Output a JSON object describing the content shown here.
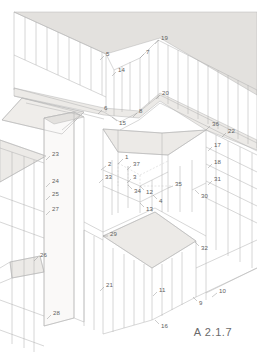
{
  "drawing": {
    "sheet_code": "A 2.1.7",
    "style": {
      "background": "#ffffff",
      "line_color": "#b4b4b4",
      "line_color_dark": "#9a9a9a",
      "plane_fill": "#e3e1de",
      "plane_fill_light": "#eceae7",
      "plane_fill_pale": "#f2f1ef",
      "label_color": "#5e5e5e",
      "leader_color": "#8d8d8d",
      "hidden_line_color": "#c2c2c2"
    },
    "callouts": [
      {
        "id": "1",
        "text": "1",
        "x": 125,
        "y": 157,
        "lx1": 123,
        "ly1": 159,
        "lx2": 118,
        "ly2": 164
      },
      {
        "id": "2",
        "text": "2",
        "x": 108,
        "y": 164,
        "lx1": 106,
        "ly1": 166,
        "lx2": 101,
        "ly2": 170
      },
      {
        "id": "3",
        "text": "3",
        "x": 133,
        "y": 177,
        "lx1": 131,
        "ly1": 179,
        "lx2": 127,
        "ly2": 183
      },
      {
        "id": "4",
        "text": "4",
        "x": 159,
        "y": 201,
        "lx1": 157,
        "ly1": 199,
        "lx2": 153,
        "ly2": 195
      },
      {
        "id": "5",
        "text": "5",
        "x": 106,
        "y": 54,
        "lx1": 104,
        "ly1": 56,
        "lx2": 100,
        "ly2": 60
      },
      {
        "id": "6",
        "text": "6",
        "x": 104,
        "y": 108,
        "lx1": 102,
        "ly1": 110,
        "lx2": 98,
        "ly2": 114
      },
      {
        "id": "7",
        "text": "7",
        "x": 146,
        "y": 52,
        "lx1": 144,
        "ly1": 54,
        "lx2": 140,
        "ly2": 58
      },
      {
        "id": "8",
        "text": "8",
        "x": 139,
        "y": 111,
        "lx1": 137,
        "ly1": 113,
        "lx2": 133,
        "ly2": 117
      },
      {
        "id": "9",
        "text": "9",
        "x": 199,
        "y": 303,
        "lx1": 197,
        "ly1": 301,
        "lx2": 193,
        "ly2": 297
      },
      {
        "id": "10",
        "text": "10",
        "x": 219,
        "y": 291,
        "lx1": 217,
        "ly1": 293,
        "lx2": 212,
        "ly2": 297
      },
      {
        "id": "11",
        "text": "11",
        "x": 159,
        "y": 290,
        "lx1": 157,
        "ly1": 292,
        "lx2": 153,
        "ly2": 296
      },
      {
        "id": "12",
        "text": "12",
        "x": 146,
        "y": 192,
        "lx1": 144,
        "ly1": 190,
        "lx2": 140,
        "ly2": 186
      },
      {
        "id": "13",
        "text": "13",
        "x": 146,
        "y": 209,
        "lx1": 144,
        "ly1": 207,
        "lx2": 140,
        "ly2": 203
      },
      {
        "id": "14",
        "text": "14",
        "x": 118,
        "y": 70,
        "lx1": 116,
        "ly1": 72,
        "lx2": 112,
        "ly2": 76
      },
      {
        "id": "15",
        "text": "15",
        "x": 119,
        "y": 123,
        "lx1": 117,
        "ly1": 121,
        "lx2": 112,
        "ly2": 117
      },
      {
        "id": "16",
        "text": "16",
        "x": 161,
        "y": 326,
        "lx1": 159,
        "ly1": 324,
        "lx2": 155,
        "ly2": 320
      },
      {
        "id": "17",
        "text": "17",
        "x": 214,
        "y": 145,
        "lx1": 212,
        "ly1": 147,
        "lx2": 208,
        "ly2": 151
      },
      {
        "id": "18",
        "text": "18",
        "x": 214,
        "y": 162,
        "lx1": 212,
        "ly1": 164,
        "lx2": 208,
        "ly2": 168
      },
      {
        "id": "19",
        "text": "19",
        "x": 161,
        "y": 38,
        "lx1": 159,
        "ly1": 40,
        "lx2": 155,
        "ly2": 44
      },
      {
        "id": "20",
        "text": "20",
        "x": 162,
        "y": 93,
        "lx1": 160,
        "ly1": 95,
        "lx2": 156,
        "ly2": 99
      },
      {
        "id": "21",
        "text": "21",
        "x": 106,
        "y": 285,
        "lx1": 104,
        "ly1": 287,
        "lx2": 100,
        "ly2": 291
      },
      {
        "id": "22",
        "text": "22",
        "x": 228,
        "y": 131,
        "lx1": 226,
        "ly1": 133,
        "lx2": 222,
        "ly2": 137
      },
      {
        "id": "23",
        "text": "23",
        "x": 52,
        "y": 154,
        "lx1": 50,
        "ly1": 156,
        "lx2": 46,
        "ly2": 160
      },
      {
        "id": "24",
        "text": "24",
        "x": 52,
        "y": 181,
        "lx1": 50,
        "ly1": 183,
        "lx2": 46,
        "ly2": 187
      },
      {
        "id": "25",
        "text": "25",
        "x": 52,
        "y": 194,
        "lx1": 50,
        "ly1": 196,
        "lx2": 46,
        "ly2": 200
      },
      {
        "id": "26",
        "text": "26",
        "x": 40,
        "y": 255,
        "lx1": 38,
        "ly1": 257,
        "lx2": 34,
        "ly2": 261
      },
      {
        "id": "27",
        "text": "27",
        "x": 52,
        "y": 209,
        "lx1": 50,
        "ly1": 211,
        "lx2": 46,
        "ly2": 215
      },
      {
        "id": "28",
        "text": "28",
        "x": 53,
        "y": 313,
        "lx1": 51,
        "ly1": 315,
        "lx2": 47,
        "ly2": 319
      },
      {
        "id": "29",
        "text": "29",
        "x": 110,
        "y": 234,
        "lx1": 108,
        "ly1": 236,
        "lx2": 103,
        "ly2": 236
      },
      {
        "id": "30",
        "text": "30",
        "x": 201,
        "y": 196,
        "lx1": 199,
        "ly1": 194,
        "lx2": 195,
        "ly2": 190
      },
      {
        "id": "31",
        "text": "31",
        "x": 214,
        "y": 179,
        "lx1": 212,
        "ly1": 181,
        "lx2": 208,
        "ly2": 185
      },
      {
        "id": "32",
        "text": "32",
        "x": 201,
        "y": 248,
        "lx1": 199,
        "ly1": 246,
        "lx2": 195,
        "ly2": 242
      },
      {
        "id": "33",
        "text": "33",
        "x": 105,
        "y": 177,
        "lx1": 103,
        "ly1": 179,
        "lx2": 99,
        "ly2": 183
      },
      {
        "id": "34",
        "text": "34",
        "x": 134,
        "y": 191,
        "lx1": 132,
        "ly1": 189,
        "lx2": 128,
        "ly2": 185
      },
      {
        "id": "35",
        "text": "35",
        "x": 175,
        "y": 184,
        "lx1": 173,
        "ly1": 186,
        "lx2": 168,
        "ly2": 188
      },
      {
        "id": "36",
        "text": "36",
        "x": 212,
        "y": 124,
        "lx1": 210,
        "ly1": 126,
        "lx2": 206,
        "ly2": 130
      },
      {
        "id": "37",
        "text": "37",
        "x": 133,
        "y": 164,
        "lx1": 131,
        "ly1": 166,
        "lx2": 127,
        "ly2": 170
      }
    ]
  }
}
